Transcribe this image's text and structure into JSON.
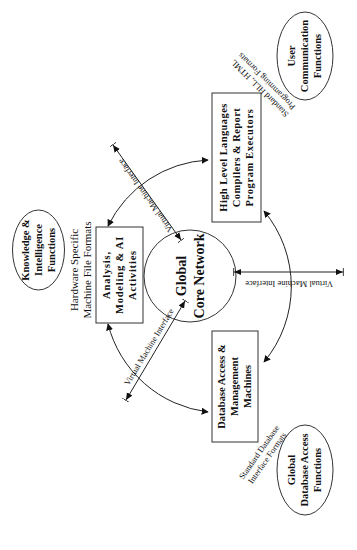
{
  "diagram": {
    "center": {
      "label_lines": [
        "Global",
        "Core Network"
      ]
    },
    "boxes": {
      "analysis": {
        "label_lines": [
          "Analysis,",
          "Modeling & AI",
          "Activities"
        ]
      },
      "hll": {
        "label_lines": [
          "High Level Languages",
          "Compilers & Report",
          "Program Executors"
        ]
      },
      "database": {
        "label_lines": [
          "Database Access &",
          "Management",
          "Machines"
        ]
      }
    },
    "ellipses": {
      "knowledge": {
        "label_lines": [
          "Knowledge &",
          "Intelligence",
          "Functions"
        ]
      },
      "user": {
        "label_lines": [
          "User",
          "Communication",
          "Functions"
        ]
      },
      "global_db": {
        "label_lines": [
          "Global",
          "Database Access",
          "Functions"
        ]
      }
    },
    "format_labels": {
      "hardware": [
        "Hardware Specific",
        "Machine File Formats"
      ],
      "hll": [
        "Standard HLL, HTML",
        "Programming Formats"
      ],
      "database": [
        "Standard Database",
        "Interface Formats"
      ]
    },
    "interfaces": {
      "upper": "Virtual Machine Interface",
      "lower": "Virtual Machine Interface",
      "right": "Virtual Machine Interface"
    },
    "colors": {
      "stroke": "#222222",
      "text": "#111111",
      "background": "#ffffff"
    }
  }
}
